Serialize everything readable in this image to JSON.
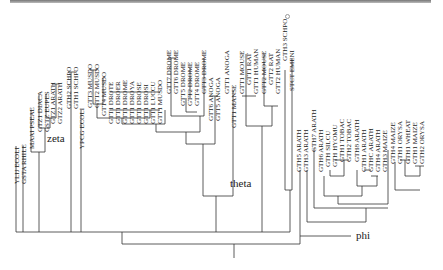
{
  "figure": {
    "type": "phylogenetic-tree",
    "clades": [
      {
        "name": "zeta",
        "x": 47,
        "y": 132
      },
      {
        "name": "theta",
        "x": 230,
        "y": 177
      },
      {
        "name": "phi",
        "x": 356,
        "y": 229
      }
    ],
    "leaves": [
      {
        "label": "YLIJ ECOLI",
        "x": 17,
        "top": 138
      },
      {
        "label": "GSTA RHILE",
        "x": 24,
        "top": 138
      },
      {
        "label": "MAAI PSEAE",
        "x": 32,
        "top": 103
      },
      {
        "label": "GTZ1 DIACA",
        "x": 40,
        "top": 86
      },
      {
        "label": "GSTZ EUPES",
        "x": 47,
        "top": 86
      },
      {
        "label": "GTZ1 ARATH",
        "x": 53,
        "top": 78
      },
      {
        "label": "GTZ2 ARATH",
        "x": 60,
        "top": 78
      },
      {
        "label": "GTH2 SCHPO",
        "x": 69,
        "top": 63
      },
      {
        "label": "GTH1 SCHPO",
        "x": 76,
        "top": 63
      },
      {
        "label": "YPCG ECOLI",
        "x": 82,
        "top": 103
      },
      {
        "label": "GTT3 MUSDO",
        "x": 90,
        "top": 62
      },
      {
        "label": "GTT2 MUSDO",
        "x": 97,
        "top": 62
      },
      {
        "label": "GTT4 MUSDO",
        "x": 104,
        "top": 70
      },
      {
        "label": "GTT1 DROTE",
        "x": 111,
        "top": 78
      },
      {
        "label": "GTT1 DROER",
        "x": 118,
        "top": 78
      },
      {
        "label": "GTT1 DROME",
        "x": 125,
        "top": 78
      },
      {
        "label": "GTT1 DROYA",
        "x": 132,
        "top": 78
      },
      {
        "label": "GTT1 DROSE",
        "x": 139,
        "top": 78
      },
      {
        "label": "GTT1 DROSI",
        "x": 146,
        "top": 78
      },
      {
        "label": "GTT1 LUCCU",
        "x": 153,
        "top": 78
      },
      {
        "label": "GTT1 MUSDO",
        "x": 160,
        "top": 78
      },
      {
        "label": "GTT7 DROME",
        "x": 169,
        "top": 48
      },
      {
        "label": "GTT6 DROME",
        "x": 176,
        "top": 48
      },
      {
        "label": "GTT5 DROME",
        "x": 183,
        "top": 60
      },
      {
        "label": "GTT2 DROME",
        "x": 190,
        "top": 60
      },
      {
        "label": "GTT4 DROME",
        "x": 197,
        "top": 60
      },
      {
        "label": "GTT3 DROME",
        "x": 204,
        "top": 48
      },
      {
        "label": "GTT6 ANOGA",
        "x": 211,
        "top": 75
      },
      {
        "label": "GTT5 ANOGA",
        "x": 218,
        "top": 75
      },
      {
        "label": "GTT1 ANOGA",
        "x": 227,
        "top": 48
      },
      {
        "label": "GTT1 MANSE",
        "x": 234,
        "top": 82
      },
      {
        "label": "GTT1 MOUSE",
        "x": 242,
        "top": 48
      },
      {
        "label": "GTT1 RAT",
        "x": 249,
        "top": 48
      },
      {
        "label": "GTT1 HUMAN",
        "x": 256,
        "top": 48
      },
      {
        "label": "GTT2 MOUSE",
        "x": 264,
        "top": 48
      },
      {
        "label": "GTT2 RAT",
        "x": 271,
        "top": 48
      },
      {
        "label": "GTT2 HUMAN",
        "x": 278,
        "top": 48
      },
      {
        "label": "GTH3 SCHPO",
        "x": 285,
        "top": 15
      },
      {
        "label": "STCT EMENI",
        "x": 292,
        "top": 45
      },
      {
        "label": "GTH5 ARATH",
        "x": 299,
        "top": 126
      },
      {
        "label": "GTH3 ARATH",
        "x": 306,
        "top": 126
      },
      {
        "label": "GTH7 ARATH",
        "x": 314,
        "top": 106
      },
      {
        "label": "GTH6 ARATH",
        "x": 321,
        "top": 126
      },
      {
        "label": "GTH SILCU",
        "x": 328,
        "top": 126
      },
      {
        "label": "GTH HYOMU",
        "x": 335,
        "top": 126
      },
      {
        "label": "GTH1 TOBAC",
        "x": 342,
        "top": 116
      },
      {
        "label": "GTH2 TOBAC",
        "x": 349,
        "top": 116
      },
      {
        "label": "GTH8 ARATH",
        "x": 357,
        "top": 116
      },
      {
        "label": "GTH1 ARATH",
        "x": 364,
        "top": 126
      },
      {
        "label": "GTHC ARATH",
        "x": 371,
        "top": 126
      },
      {
        "label": "GTH4 ARATH",
        "x": 378,
        "top": 126
      },
      {
        "label": "GTH3 MAIZE",
        "x": 385,
        "top": 126
      },
      {
        "label": "GTH4 MAIZE",
        "x": 393,
        "top": 118
      },
      {
        "label": "GTH1 ORYSA",
        "x": 400,
        "top": 118
      },
      {
        "label": "GTH1 WHEAT",
        "x": 408,
        "top": 118
      },
      {
        "label": "GTH1 MAIZE",
        "x": 415,
        "top": 118
      },
      {
        "label": "GTH2 ORYSA",
        "x": 422,
        "top": 118
      }
    ]
  }
}
